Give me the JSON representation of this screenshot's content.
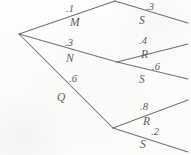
{
  "diagram": {
    "type": "tree",
    "background_color": "#fdfdfc",
    "line_color": "#5e5e62",
    "text_color": "#4b4b50",
    "root": {
      "label": "",
      "x": 19,
      "y": 34
    },
    "branches": [
      {
        "id": "branch-m",
        "probability": ".1",
        "node_label": "M",
        "prob_x": 66,
        "prob_y": 4,
        "node_x": 70,
        "node_y": 17,
        "from_x": 19,
        "from_y": 34,
        "to_x": 115,
        "to_y": 1
      },
      {
        "id": "branch-n",
        "probability": ".3",
        "node_label": "N",
        "prob_x": 65,
        "prob_y": 38,
        "node_x": 66,
        "node_y": 53,
        "from_x": 19,
        "from_y": 34,
        "to_x": 117,
        "to_y": 62
      },
      {
        "id": "branch-q",
        "probability": ".6",
        "node_label": "Q",
        "prob_x": 69,
        "prob_y": 74,
        "node_x": 57,
        "node_y": 92,
        "from_x": 19,
        "from_y": 34,
        "to_x": 113,
        "to_y": 128
      },
      {
        "id": "branch-m-s",
        "probability": ".3",
        "node_label": "S",
        "prob_x": 146,
        "prob_y": 2,
        "node_x": 139,
        "node_y": 15,
        "from_x": 115,
        "from_y": 1,
        "to_x": 188,
        "to_y": 23
      },
      {
        "id": "branch-n-r",
        "probability": ".4",
        "node_label": "R",
        "prob_x": 139,
        "prob_y": 36,
        "node_x": 141,
        "node_y": 49,
        "from_x": 117,
        "from_y": 62,
        "to_x": 188,
        "to_y": 44
      },
      {
        "id": "branch-n-s",
        "probability": ".6",
        "node_label": "S",
        "prob_x": 152,
        "prob_y": 62,
        "node_x": 139,
        "node_y": 74,
        "from_x": 117,
        "from_y": 62,
        "to_x": 188,
        "to_y": 79
      },
      {
        "id": "branch-q-r",
        "probability": ".8",
        "node_label": "R",
        "prob_x": 140,
        "prob_y": 102,
        "node_x": 143,
        "node_y": 116,
        "from_x": 113,
        "from_y": 128,
        "to_x": 188,
        "to_y": 100
      },
      {
        "id": "branch-q-s",
        "probability": ".2",
        "node_label": "S",
        "prob_x": 151,
        "prob_y": 127,
        "node_x": 140,
        "node_y": 139,
        "from_x": 113,
        "from_y": 128,
        "to_x": 188,
        "to_y": 152
      }
    ]
  }
}
